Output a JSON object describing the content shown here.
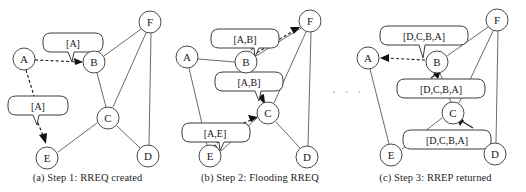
{
  "figure": {
    "ellipsis": "· · ·",
    "colors": {
      "node_stroke": "#4a4a4a",
      "edge": "#5a5a5a",
      "bubble_stroke": "#3c3c3c",
      "arrow": "#111111",
      "text": "#1a1a1a",
      "background": "#ffffff"
    }
  },
  "panels": [
    {
      "id": "a",
      "caption": "(a) Step 1: RREQ created",
      "nodes": [
        {
          "id": "A",
          "label": "A",
          "cx": 24,
          "cy": 59
        },
        {
          "id": "B",
          "label": "B",
          "cx": 94,
          "cy": 62
        },
        {
          "id": "C",
          "label": "C",
          "cx": 108,
          "cy": 118
        },
        {
          "id": "D",
          "label": "D",
          "cx": 148,
          "cy": 156
        },
        {
          "id": "E",
          "label": "E",
          "cx": 47,
          "cy": 158
        },
        {
          "id": "F",
          "label": "F",
          "cx": 150,
          "cy": 22
        }
      ],
      "edges": [
        {
          "from": "B",
          "to": "F"
        },
        {
          "from": "B",
          "to": "C"
        },
        {
          "from": "C",
          "to": "F"
        },
        {
          "from": "C",
          "to": "D"
        },
        {
          "from": "C",
          "to": "E"
        },
        {
          "from": "D",
          "to": "F"
        }
      ],
      "messages": [
        {
          "text": "[A]",
          "bx": 43,
          "by": 33,
          "bw": 60,
          "bh": 17,
          "tail_x": 72,
          "tail_y": 50,
          "tail_tip_x": 67,
          "tail_tip_y": 62,
          "from": "A",
          "to": "B",
          "style": "dashed"
        },
        {
          "text": "[A]",
          "bx": 8,
          "by": 96,
          "bh": 17,
          "bw": 60,
          "tail_x": 33,
          "tail_y": 113,
          "tail_tip_x": 40,
          "tail_tip_y": 124,
          "from": "A",
          "to": "E",
          "style": "dashed"
        }
      ]
    },
    {
      "id": "b",
      "caption": "(b) Step 2: Flooding RREQ",
      "nodes": [
        {
          "id": "A",
          "label": "A",
          "cx": 12,
          "cy": 57
        },
        {
          "id": "B",
          "label": "B",
          "cx": 71,
          "cy": 62
        },
        {
          "id": "C",
          "label": "C",
          "cx": 93,
          "cy": 113
        },
        {
          "id": "D",
          "label": "D",
          "cx": 132,
          "cy": 157
        },
        {
          "id": "E",
          "label": "E",
          "cx": 35,
          "cy": 156
        },
        {
          "id": "F",
          "label": "F",
          "cx": 135,
          "cy": 21
        }
      ],
      "edges": [
        {
          "from": "A",
          "to": "B"
        },
        {
          "from": "A",
          "to": "E"
        },
        {
          "from": "B",
          "to": "F"
        },
        {
          "from": "B",
          "to": "C"
        },
        {
          "from": "C",
          "to": "F"
        },
        {
          "from": "C",
          "to": "D"
        },
        {
          "from": "C",
          "to": "E"
        },
        {
          "from": "D",
          "to": "F"
        }
      ],
      "messages": [
        {
          "text": "[A,B]",
          "bx": 36,
          "by": 29,
          "bw": 68,
          "bh": 17,
          "from": "B",
          "to": "F",
          "style": "dashed"
        },
        {
          "text": "[A,B]",
          "bx": 40,
          "by": 72,
          "bw": 68,
          "bh": 17,
          "from": "B",
          "to": "C",
          "style": "dashed"
        },
        {
          "text": "[A,E]",
          "bx": 7,
          "by": 123,
          "bw": 68,
          "bh": 17,
          "from": "E",
          "to": "C",
          "style": "dashed"
        }
      ]
    },
    {
      "id": "c",
      "caption": "(c) Step 3: RREP returned",
      "nodes": [
        {
          "id": "A",
          "label": "A",
          "cx": 23,
          "cy": 58
        },
        {
          "id": "B",
          "label": "B",
          "cx": 92,
          "cy": 62
        },
        {
          "id": "C",
          "label": "C",
          "cx": 108,
          "cy": 113
        },
        {
          "id": "D",
          "label": "D",
          "cx": 150,
          "cy": 154
        },
        {
          "id": "E",
          "label": "E",
          "cx": 46,
          "cy": 155
        },
        {
          "id": "F",
          "label": "F",
          "cx": 152,
          "cy": 20
        }
      ],
      "edges": [
        {
          "from": "A",
          "to": "E"
        },
        {
          "from": "B",
          "to": "F"
        },
        {
          "from": "B",
          "to": "C"
        },
        {
          "from": "C",
          "to": "F"
        },
        {
          "from": "C",
          "to": "E"
        },
        {
          "from": "D",
          "to": "F"
        }
      ],
      "messages": [
        {
          "text": "[D,C,B,A]",
          "bx": 35,
          "by": 26,
          "bw": 88,
          "bh": 17,
          "from": "B",
          "to": "A",
          "style": "dashed"
        },
        {
          "text": "[D,C,B,A]",
          "bx": 52,
          "by": 79,
          "bw": 88,
          "bh": 17,
          "from": "C",
          "to": "B",
          "style": "solid"
        },
        {
          "text": "[D,C,B,A]",
          "bx": 58,
          "by": 130,
          "bw": 88,
          "bh": 17,
          "from": "D",
          "to": "C",
          "style": "solid"
        }
      ]
    }
  ]
}
